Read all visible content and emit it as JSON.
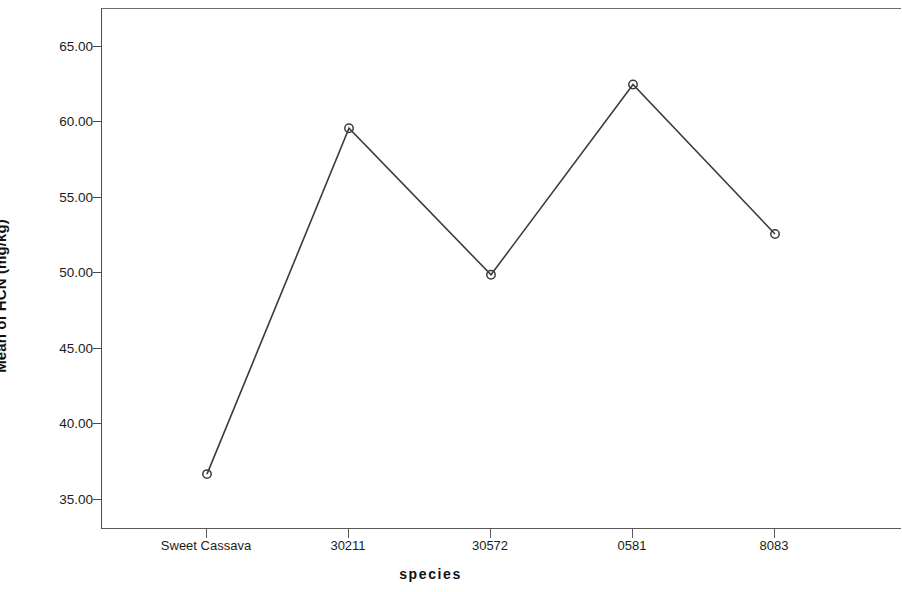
{
  "chart_data": {
    "type": "line",
    "title": "",
    "xlabel": "species",
    "ylabel": "Mean of HCN (mg/kg)",
    "categories": [
      "Sweet Cassava",
      "30211",
      "30572",
      "0581",
      "8083"
    ],
    "values": [
      36.7,
      59.6,
      49.9,
      62.5,
      52.6
    ],
    "series": [
      {
        "name": "Mean of HCN (mg/kg)",
        "values": [
          36.7,
          59.6,
          49.9,
          62.5,
          52.6
        ]
      }
    ],
    "ylim": [
      33.0,
      67.5
    ],
    "yticks": [
      35.0,
      40.0,
      45.0,
      50.0,
      55.0,
      60.0,
      65.0
    ],
    "ytick_labels": [
      "35.00",
      "40.00",
      "45.00",
      "50.00",
      "55.00",
      "60.00",
      "65.00"
    ],
    "grid": false,
    "legend": false,
    "legend_position": "none",
    "marker": "open-circle",
    "line_color": "#3c3c3c",
    "marker_color": "#3c3c3c",
    "background_color": "#ffffff",
    "axis_color": "#4a4a4a"
  }
}
